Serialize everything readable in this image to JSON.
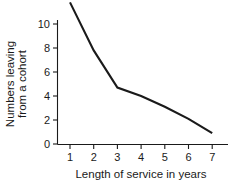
{
  "chart_data": {
    "type": "line",
    "title": "",
    "subtitle": "",
    "xlabel": "Length of service in years",
    "ylabel": "Numbers leaving from a cohort",
    "ylabel_line1": "Numbers leaving",
    "ylabel_line2": "from a cohort",
    "x": [
      1,
      2,
      3,
      4,
      5,
      6,
      7
    ],
    "values": [
      11.8,
      7.8,
      4.7,
      4.0,
      3.1,
      2.1,
      0.9
    ],
    "series": [
      {
        "name": "Numbers leaving from a cohort",
        "values": [
          11.8,
          7.8,
          4.7,
          4.0,
          3.1,
          2.1,
          0.9
        ]
      }
    ],
    "xlim": [
      0.6,
      7.4
    ],
    "ylim": [
      0,
      12
    ],
    "xticks": [
      1,
      2,
      3,
      4,
      5,
      6,
      7
    ],
    "yticks": [
      0,
      2,
      4,
      6,
      8,
      10
    ],
    "xtick_labels": [
      "1",
      "2",
      "3",
      "4",
      "5",
      "6",
      "7"
    ],
    "ytick_labels": [
      "0",
      "2",
      "4",
      "6",
      "8",
      "10"
    ],
    "grid": false,
    "legend": false,
    "legend_position": "none",
    "line_color": "#1a1a1a",
    "background_color": "#ffffff",
    "markers": false,
    "annotations": []
  }
}
